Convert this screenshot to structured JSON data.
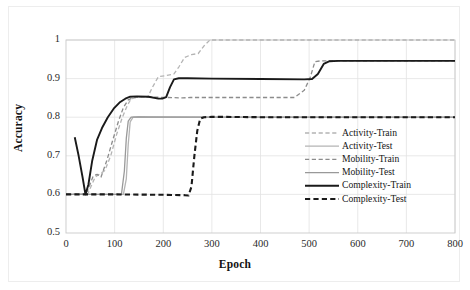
{
  "chart_data": {
    "type": "line",
    "title": "",
    "xlabel": "Epoch",
    "ylabel": "Accuracy",
    "xlim": [
      0,
      800
    ],
    "ylim": [
      0.5,
      1
    ],
    "xticks": [
      0,
      100,
      200,
      300,
      400,
      500,
      600,
      700,
      800
    ],
    "yticks": [
      "0.5",
      "0.6",
      "0.7",
      "0.8",
      "0.9",
      "1"
    ],
    "xtick_labels": [
      "0",
      "100",
      "200",
      "300",
      "400",
      "500",
      "600",
      "700",
      "800"
    ],
    "grid": true,
    "legend_position": "right-lower",
    "series": [
      {
        "name": "Activity-Train",
        "style": "dashed",
        "color": "#b4b4b4",
        "width": 1.3,
        "points": [
          [
            0,
            0.6
          ],
          [
            30,
            0.6
          ],
          [
            45,
            0.602
          ],
          [
            60,
            0.645
          ],
          [
            72,
            0.655
          ],
          [
            80,
            0.662
          ],
          [
            92,
            0.7
          ],
          [
            104,
            0.755
          ],
          [
            116,
            0.8
          ],
          [
            126,
            0.83
          ],
          [
            134,
            0.848
          ],
          [
            150,
            0.852
          ],
          [
            168,
            0.852
          ],
          [
            178,
            0.878
          ],
          [
            190,
            0.905
          ],
          [
            206,
            0.908
          ],
          [
            222,
            0.912
          ],
          [
            232,
            0.93
          ],
          [
            244,
            0.955
          ],
          [
            258,
            0.962
          ],
          [
            272,
            0.965
          ],
          [
            284,
            0.985
          ],
          [
            296,
            1.0
          ],
          [
            800,
            1.0
          ]
        ]
      },
      {
        "name": "Activity-Test",
        "style": "solid",
        "color": "#b4b4b4",
        "width": 1.3,
        "points": [
          [
            0,
            0.6
          ],
          [
            118,
            0.6
          ],
          [
            124,
            0.64
          ],
          [
            128,
            0.73
          ],
          [
            132,
            0.788
          ],
          [
            138,
            0.8
          ],
          [
            150,
            0.801
          ],
          [
            170,
            0.8
          ],
          [
            800,
            0.8
          ]
        ]
      },
      {
        "name": "Mobility-Train",
        "style": "dashed",
        "color": "#8c8c8c",
        "width": 1.3,
        "points": [
          [
            0,
            0.6
          ],
          [
            34,
            0.6
          ],
          [
            44,
            0.608
          ],
          [
            56,
            0.648
          ],
          [
            64,
            0.652
          ],
          [
            72,
            0.645
          ],
          [
            84,
            0.688
          ],
          [
            96,
            0.74
          ],
          [
            108,
            0.79
          ],
          [
            118,
            0.825
          ],
          [
            128,
            0.845
          ],
          [
            140,
            0.852
          ],
          [
            180,
            0.852
          ],
          [
            210,
            0.851
          ],
          [
            240,
            0.85
          ],
          [
            256,
            0.851
          ],
          [
            470,
            0.851
          ],
          [
            490,
            0.87
          ],
          [
            502,
            0.902
          ],
          [
            512,
            0.944
          ],
          [
            524,
            0.946
          ],
          [
            800,
            0.946
          ]
        ]
      },
      {
        "name": "Mobility-Test",
        "style": "solid",
        "color": "#999999",
        "width": 1.3,
        "points": [
          [
            0,
            0.6
          ],
          [
            114,
            0.6
          ],
          [
            120,
            0.66
          ],
          [
            124,
            0.745
          ],
          [
            128,
            0.79
          ],
          [
            134,
            0.8
          ],
          [
            150,
            0.801
          ],
          [
            300,
            0.8
          ],
          [
            800,
            0.8
          ]
        ]
      },
      {
        "name": "Complexity-Train",
        "style": "solid",
        "color": "#1a1a1a",
        "width": 1.9,
        "points": [
          [
            18,
            0.748
          ],
          [
            26,
            0.7
          ],
          [
            34,
            0.645
          ],
          [
            40,
            0.6
          ],
          [
            46,
            0.625
          ],
          [
            54,
            0.688
          ],
          [
            64,
            0.742
          ],
          [
            74,
            0.772
          ],
          [
            86,
            0.8
          ],
          [
            98,
            0.822
          ],
          [
            110,
            0.838
          ],
          [
            122,
            0.848
          ],
          [
            132,
            0.853
          ],
          [
            146,
            0.854
          ],
          [
            170,
            0.853
          ],
          [
            190,
            0.848
          ],
          [
            198,
            0.848
          ],
          [
            206,
            0.852
          ],
          [
            214,
            0.878
          ],
          [
            222,
            0.898
          ],
          [
            232,
            0.901
          ],
          [
            250,
            0.901
          ],
          [
            300,
            0.9
          ],
          [
            400,
            0.899
          ],
          [
            490,
            0.898
          ],
          [
            506,
            0.899
          ],
          [
            518,
            0.912
          ],
          [
            530,
            0.938
          ],
          [
            542,
            0.945
          ],
          [
            560,
            0.946
          ],
          [
            800,
            0.946
          ]
        ]
      },
      {
        "name": "Complexity-Test",
        "style": "dashed-bold",
        "color": "#1a1a1a",
        "width": 2.1,
        "points": [
          [
            0,
            0.6
          ],
          [
            100,
            0.6
          ],
          [
            200,
            0.599
          ],
          [
            244,
            0.598
          ],
          [
            252,
            0.597
          ],
          [
            258,
            0.62
          ],
          [
            264,
            0.7
          ],
          [
            270,
            0.765
          ],
          [
            276,
            0.796
          ],
          [
            284,
            0.8
          ],
          [
            300,
            0.801
          ],
          [
            400,
            0.8
          ],
          [
            800,
            0.8
          ]
        ]
      }
    ]
  },
  "legend": {
    "items": [
      {
        "label": "Activity-Train"
      },
      {
        "label": "Activity-Test"
      },
      {
        "label": "Mobility-Train"
      },
      {
        "label": "Mobility-Test"
      },
      {
        "label": "Complexity-Train"
      },
      {
        "label": "Complexity-Test"
      }
    ]
  }
}
